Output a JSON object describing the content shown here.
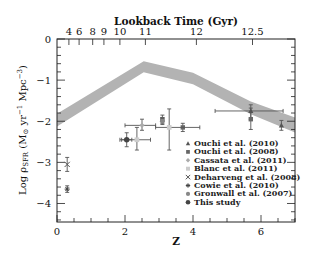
{
  "chart_data": {
    "type": "scatter",
    "title": "",
    "xlabel": "z",
    "ylabel": "Log ρSFR (M⊙ yr⁻¹ Mpc⁻³)",
    "top_xlabel": "Lookback Time (Gyr)",
    "xlim": [
      0,
      7
    ],
    "ylim": [
      -4.45,
      0
    ],
    "grid": false,
    "x_ticks": [
      0,
      2,
      4,
      6
    ],
    "x_tick_labels": [
      "0",
      "2",
      "4",
      "6"
    ],
    "y_ticks": [
      0,
      -1,
      -2,
      -3,
      -4
    ],
    "y_tick_labels": [
      "0",
      "−1",
      "−2",
      "−3",
      "−4"
    ],
    "top_ticks": [
      {
        "label": "4",
        "z": 0.35
      },
      {
        "label": "6",
        "z": 0.65
      },
      {
        "label": "8",
        "z": 1.05
      },
      {
        "label": "9",
        "z": 1.38
      },
      {
        "label": "10",
        "z": 1.85
      },
      {
        "label": "11",
        "z": 2.6
      },
      {
        "label": "12",
        "z": 4.1
      },
      {
        "label": "12.5",
        "z": 5.75
      }
    ],
    "band": {
      "name": "SFRD model band",
      "z": [
        0,
        2.55,
        4.0,
        5.7,
        7.0
      ],
      "upper": [
        -1.82,
        -0.54,
        -0.82,
        -1.52,
        -1.91
      ],
      "lower": [
        -2.13,
        -0.81,
        -1.1,
        -1.83,
        -2.27
      ],
      "color": "#b3b3b3"
    },
    "legend_position": "lower right",
    "series": [
      {
        "name": "Ouchi et al. (2010)",
        "marker": "triangle",
        "color": "#555555",
        "points": [
          {
            "z": 5.7,
            "y": -1.75,
            "yerr": [
              0.2,
              0.15
            ],
            "xerr": [
              1.05,
              0.95
            ]
          },
          {
            "z": 6.6,
            "y": -2.1,
            "yerr": [
              0.12,
              0.12
            ]
          }
        ]
      },
      {
        "name": "Ouchi et al. (2008)",
        "marker": "square",
        "color": "#666666",
        "points": [
          {
            "z": 3.1,
            "y": -1.95,
            "yerr": [
              0.1,
              0.1
            ]
          },
          {
            "z": 3.7,
            "y": -2.15,
            "yerr": [
              0.1,
              0.1
            ]
          },
          {
            "z": 5.7,
            "y": -1.95,
            "yerr": [
              0.25,
              0.27
            ]
          }
        ]
      },
      {
        "name": "Cassata et al. (2011)",
        "marker": "diamond",
        "color": "#aaaaaa",
        "points": [
          {
            "z": 2.5,
            "y": -2.1,
            "yerr": [
              0.12,
              0.15
            ],
            "xerr": [
              0.5,
              0.4
            ]
          }
        ]
      },
      {
        "name": "Blanc et al. (2011)",
        "marker": "square-light",
        "color": "#cccccc",
        "points": [
          {
            "z": 2.35,
            "y": -2.45,
            "yerr": [
              0.25,
              0.3
            ],
            "xerr": [
              0.5,
              0.4
            ]
          },
          {
            "z": 3.3,
            "y": -2.15,
            "yerr": [
              0.55,
              0.45
            ],
            "xerr": [
              0.4,
              0.9
            ]
          }
        ]
      },
      {
        "name": "Deharveng et al. (2008)",
        "marker": "x",
        "color": "#555555",
        "points": [
          {
            "z": 0.3,
            "y": -3.05,
            "yerr": [
              0.17,
              0.17
            ]
          }
        ]
      },
      {
        "name": "Cowie et al. (2010)",
        "marker": "asterisk",
        "color": "#444444",
        "points": [
          {
            "z": 0.3,
            "y": -3.65,
            "yerr": [
              0.08,
              0.08
            ]
          }
        ]
      },
      {
        "name": "Gronwall et al. (2007)",
        "marker": "circle",
        "color": "#888888",
        "points": [
          {
            "z": 3.1,
            "y": -2.0,
            "yerr": [
              0.08,
              0.08
            ]
          }
        ]
      },
      {
        "name": "This study",
        "marker": "circle-dark",
        "color": "#444444",
        "points": [
          {
            "z": 2.05,
            "y": -2.45,
            "yerr": [
              0.17,
              0.17
            ],
            "xerr": [
              0.15,
              0.15
            ]
          }
        ]
      }
    ]
  }
}
